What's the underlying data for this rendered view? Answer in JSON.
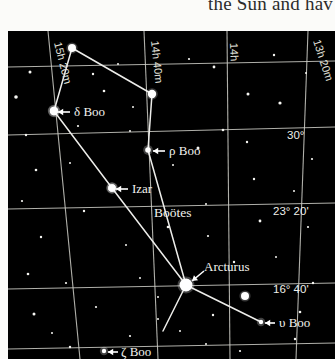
{
  "page": {
    "body_text_fragment": "the Sun and hav"
  },
  "chart": {
    "background_color": "#000000",
    "ink_color": "#f2f2ee",
    "constellation_label": "Boötes",
    "grid": {
      "ra_labels": [
        {
          "text": "15h 20m",
          "x": 46,
          "y": 12,
          "rotate": 76
        },
        {
          "text": "14h 40m",
          "x": 143,
          "y": 10,
          "rotate": 84
        },
        {
          "text": "14h",
          "x": 222,
          "y": 12,
          "rotate": 88
        },
        {
          "text": "13h 20m",
          "x": 305,
          "y": 10,
          "rotate": 72
        }
      ],
      "dec_labels": [
        {
          "text": "30°",
          "x": 279,
          "y": 108
        },
        {
          "text": "23° 20'",
          "x": 265,
          "y": 184
        },
        {
          "text": "16° 40'",
          "x": 265,
          "y": 262
        }
      ]
    },
    "stars": [
      {
        "name": "delta-boo",
        "label": "δ Boo",
        "x": 46,
        "y": 80,
        "r": 4.2,
        "label_x": 66,
        "label_y": 85,
        "arrow": {
          "x1": 62,
          "y1": 81,
          "x2": 50,
          "y2": 81
        }
      },
      {
        "name": "rho-boo",
        "label": "ρ Boo",
        "x": 140,
        "y": 119,
        "r": 2.8,
        "label_x": 161,
        "label_y": 124,
        "arrow": {
          "x1": 157,
          "y1": 120,
          "x2": 145,
          "y2": 120
        }
      },
      {
        "name": "izar",
        "label": "Izar",
        "x": 104,
        "y": 157,
        "r": 3.8,
        "label_x": 124,
        "label_y": 162,
        "arrow": {
          "x1": 120,
          "y1": 158,
          "x2": 108,
          "y2": 158
        }
      },
      {
        "name": "arcturus",
        "label": "Arcturus",
        "x": 178,
        "y": 254,
        "r": 6.5,
        "label_x": 196,
        "label_y": 240,
        "arrow": {
          "x1": 196,
          "y1": 240,
          "x2": 184,
          "y2": 250
        }
      },
      {
        "name": "upsilon-boo",
        "label": "υ Boo",
        "x": 253,
        "y": 291,
        "r": 2.2,
        "label_x": 271,
        "label_y": 296,
        "arrow": {
          "x1": 267,
          "y1": 292,
          "x2": 257,
          "y2": 292
        }
      },
      {
        "name": "zeta-boo",
        "label": "ζ Boo",
        "x": 96,
        "y": 320,
        "r": 2.2,
        "label_x": 113,
        "label_y": 325,
        "arrow": {
          "x1": 110,
          "y1": 321,
          "x2": 100,
          "y2": 321
        }
      }
    ],
    "bright_stars": [
      {
        "x": 64,
        "y": 17,
        "r": 4.0
      },
      {
        "x": 144,
        "y": 63,
        "r": 4.2
      },
      {
        "x": 237,
        "y": 265,
        "r": 4.0
      },
      {
        "x": 46,
        "y": 80,
        "r": 4.2
      },
      {
        "x": 104,
        "y": 157,
        "r": 3.8
      }
    ],
    "field_stars": [
      {
        "x": 22,
        "y": 41,
        "r": 1.5
      },
      {
        "x": 85,
        "y": 43,
        "r": 1.2
      },
      {
        "x": 110,
        "y": 33,
        "r": 1.0
      },
      {
        "x": 181,
        "y": 28,
        "r": 1.1
      },
      {
        "x": 206,
        "y": 36,
        "r": 1.4
      },
      {
        "x": 266,
        "y": 24,
        "r": 1.2
      },
      {
        "x": 298,
        "y": 42,
        "r": 1.0
      },
      {
        "x": 8,
        "y": 66,
        "r": 1.8
      },
      {
        "x": 96,
        "y": 60,
        "r": 1.3
      },
      {
        "x": 125,
        "y": 76,
        "r": 1.0
      },
      {
        "x": 240,
        "y": 63,
        "r": 1.5
      },
      {
        "x": 272,
        "y": 72,
        "r": 1.6
      },
      {
        "x": 18,
        "y": 104,
        "r": 1.2
      },
      {
        "x": 70,
        "y": 95,
        "r": 1.1
      },
      {
        "x": 122,
        "y": 100,
        "r": 1.0
      },
      {
        "x": 215,
        "y": 99,
        "r": 1.3
      },
      {
        "x": 239,
        "y": 111,
        "r": 1.2
      },
      {
        "x": 190,
        "y": 117,
        "r": 1.5
      },
      {
        "x": 304,
        "y": 128,
        "r": 1.1
      },
      {
        "x": 28,
        "y": 139,
        "r": 1.3
      },
      {
        "x": 62,
        "y": 132,
        "r": 1.0
      },
      {
        "x": 246,
        "y": 148,
        "r": 1.2
      },
      {
        "x": 286,
        "y": 160,
        "r": 1.0
      },
      {
        "x": 14,
        "y": 170,
        "r": 1.1
      },
      {
        "x": 76,
        "y": 180,
        "r": 1.2
      },
      {
        "x": 160,
        "y": 196,
        "r": 1.3
      },
      {
        "x": 198,
        "y": 173,
        "r": 1.0
      },
      {
        "x": 252,
        "y": 190,
        "r": 1.4
      },
      {
        "x": 300,
        "y": 196,
        "r": 1.1
      },
      {
        "x": 33,
        "y": 206,
        "r": 1.2
      },
      {
        "x": 118,
        "y": 214,
        "r": 1.0
      },
      {
        "x": 226,
        "y": 231,
        "r": 1.2
      },
      {
        "x": 268,
        "y": 226,
        "r": 1.0
      },
      {
        "x": 20,
        "y": 243,
        "r": 1.3
      },
      {
        "x": 58,
        "y": 252,
        "r": 1.1
      },
      {
        "x": 132,
        "y": 247,
        "r": 1.0
      },
      {
        "x": 305,
        "y": 252,
        "r": 1.2
      },
      {
        "x": 26,
        "y": 283,
        "r": 1.5
      },
      {
        "x": 88,
        "y": 276,
        "r": 1.1
      },
      {
        "x": 150,
        "y": 288,
        "r": 1.0
      },
      {
        "x": 205,
        "y": 284,
        "r": 1.2
      },
      {
        "x": 292,
        "y": 281,
        "r": 1.3
      },
      {
        "x": 44,
        "y": 302,
        "r": 1.0
      },
      {
        "x": 122,
        "y": 305,
        "r": 1.1
      },
      {
        "x": 172,
        "y": 300,
        "r": 1.0
      },
      {
        "x": 62,
        "y": 316,
        "r": 1.2
      },
      {
        "x": 198,
        "y": 313,
        "r": 1.0
      },
      {
        "x": 232,
        "y": 320,
        "r": 1.1
      },
      {
        "x": 287,
        "y": 308,
        "r": 1.2
      },
      {
        "x": 150,
        "y": 266,
        "r": 1.0
      },
      {
        "x": 200,
        "y": 205,
        "r": 1.1
      },
      {
        "x": 165,
        "y": 134,
        "r": 1.0
      }
    ],
    "constellation_lines": [
      {
        "from": "delta-boo",
        "to": "top-star",
        "x1": 46,
        "y1": 80,
        "x2": 64,
        "y2": 17
      },
      {
        "from": "top-star",
        "to": "star-14h40",
        "x1": 64,
        "y1": 17,
        "x2": 144,
        "y2": 63
      },
      {
        "from": "star-14h40",
        "to": "rho-boo",
        "x1": 144,
        "y1": 63,
        "x2": 140,
        "y2": 119
      },
      {
        "from": "delta-boo",
        "to": "izar",
        "x1": 46,
        "y1": 80,
        "x2": 104,
        "y2": 157
      },
      {
        "from": "izar",
        "to": "arcturus",
        "x1": 104,
        "y1": 157,
        "x2": 178,
        "y2": 254
      },
      {
        "from": "rho-boo",
        "to": "arcturus",
        "x1": 140,
        "y1": 119,
        "x2": 178,
        "y2": 254
      },
      {
        "from": "arcturus",
        "to": "upsilon-boo",
        "x1": 178,
        "y1": 254,
        "x2": 253,
        "y2": 291
      },
      {
        "from": "arcturus",
        "to": "zeta-boo",
        "x1": 178,
        "y1": 254,
        "x2": 155,
        "y2": 300
      }
    ],
    "ra_meridians": [
      {
        "x1": 40,
        "y1": 0,
        "x2": 72,
        "y2": 328
      },
      {
        "x1": 136,
        "y1": 0,
        "x2": 150,
        "y2": 328
      },
      {
        "x1": 219,
        "y1": 0,
        "x2": 222,
        "y2": 328
      },
      {
        "x1": 300,
        "y1": 0,
        "x2": 288,
        "y2": 328
      }
    ],
    "dec_parallels": [
      {
        "x1": 0,
        "y1": 104,
        "x2": 327,
        "y2": 96
      },
      {
        "x1": 0,
        "y1": 178,
        "x2": 327,
        "y2": 172
      },
      {
        "x1": 0,
        "y1": 258,
        "x2": 327,
        "y2": 252
      },
      {
        "x1": 0,
        "y1": 36,
        "x2": 327,
        "y2": 30
      },
      {
        "x1": 0,
        "y1": 318,
        "x2": 327,
        "y2": 312
      }
    ]
  }
}
